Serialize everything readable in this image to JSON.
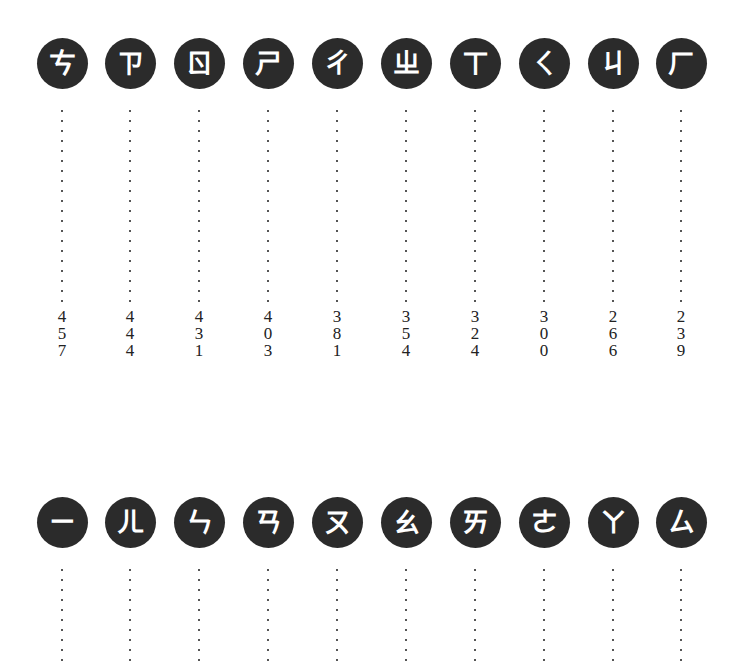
{
  "top_row": {
    "items": [
      {
        "symbol": "ㄘ",
        "digits": [
          "4",
          "5",
          "7"
        ],
        "value": "457"
      },
      {
        "symbol": "ㄗ",
        "digits": [
          "4",
          "4",
          "4"
        ],
        "value": "444"
      },
      {
        "symbol": "ㄖ",
        "digits": [
          "4",
          "3",
          "1"
        ],
        "value": "431"
      },
      {
        "symbol": "ㄕ",
        "digits": [
          "4",
          "0",
          "3"
        ],
        "value": "403"
      },
      {
        "symbol": "ㄔ",
        "digits": [
          "3",
          "8",
          "1"
        ],
        "value": "381"
      },
      {
        "symbol": "ㄓ",
        "digits": [
          "3",
          "5",
          "4"
        ],
        "value": "354"
      },
      {
        "symbol": "ㄒ",
        "digits": [
          "3",
          "2",
          "4"
        ],
        "value": "324"
      },
      {
        "symbol": "ㄑ",
        "digits": [
          "3",
          "0",
          "0"
        ],
        "value": "300"
      },
      {
        "symbol": "ㄐ",
        "digits": [
          "2",
          "6",
          "6"
        ],
        "value": "266"
      },
      {
        "symbol": "ㄏ",
        "digits": [
          "2",
          "3",
          "9"
        ],
        "value": "239"
      }
    ]
  },
  "bottom_row": {
    "items": [
      {
        "symbol": "ㄧ"
      },
      {
        "symbol": "ㄦ"
      },
      {
        "symbol": "ㄣ"
      },
      {
        "symbol": "ㄢ"
      },
      {
        "symbol": "ㄡ"
      },
      {
        "symbol": "ㄠ"
      },
      {
        "symbol": "ㄞ"
      },
      {
        "symbol": "ㄜ"
      },
      {
        "symbol": "ㄚ"
      },
      {
        "symbol": "ㄙ"
      }
    ]
  },
  "colors": {
    "badge_bg": "#2b2b2b",
    "badge_fg": "#ffffff",
    "text": "#222222"
  }
}
